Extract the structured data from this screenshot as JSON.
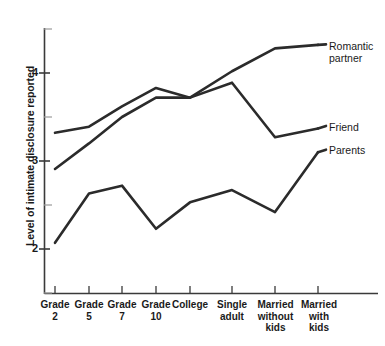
{
  "chart_data": {
    "type": "line",
    "title": "",
    "xlabel": "",
    "ylabel": "Level of intimate disclosure reported",
    "categories": [
      "Grade\n2",
      "Grade\n5",
      "Grade\n7",
      "Grade\n10",
      "College",
      "Single\nadult",
      "Married\nwithout\nkids",
      "Married\nwith\nkids"
    ],
    "yticks": [
      2,
      3,
      4
    ],
    "ytick_labels": [
      "2",
      "3",
      "4"
    ],
    "ylim": [
      1.55,
      4.65
    ],
    "grid": false,
    "legend_position": "right-inline",
    "series": [
      {
        "name": "Romantic partner",
        "values": [
          2.91,
          3.2,
          3.5,
          3.72,
          3.72,
          4.02,
          4.28,
          4.32
        ]
      },
      {
        "name": "Friend",
        "values": [
          3.32,
          3.39,
          3.62,
          3.83,
          3.72,
          3.89,
          3.27,
          3.37
        ]
      },
      {
        "name": "Parents",
        "values": [
          2.07,
          2.63,
          2.72,
          2.23,
          2.53,
          2.67,
          2.42,
          3.1
        ]
      }
    ],
    "line_color": "#2b2b2b",
    "axis_color": "#3a3a3a"
  },
  "axis": {
    "y_title": "Level of intimate disclosure reported",
    "ytick_4": "4",
    "ytick_3": "3",
    "ytick_2": "2"
  },
  "categories": {
    "c0": "Grade\n2",
    "c1": "Grade\n5",
    "c2": "Grade\n7",
    "c3": "Grade\n10",
    "c4": "College",
    "c5": "Single\nadult",
    "c6": "Married\nwithout\nkids",
    "c7": "Married\nwith\nkids"
  },
  "legend": {
    "romantic": "Romantic\npartner",
    "friend": "Friend",
    "parents": "Parents"
  }
}
